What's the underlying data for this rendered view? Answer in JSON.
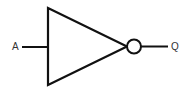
{
  "diagram": {
    "type": "logic-gate",
    "gate": "NOT",
    "input_label": "A",
    "output_label": "Q",
    "stroke_color": "#111111"
  }
}
